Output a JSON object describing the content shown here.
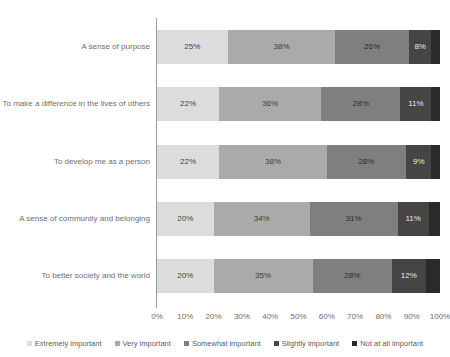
{
  "chart_data": {
    "type": "bar",
    "orientation": "horizontal",
    "stacked": true,
    "title": "",
    "xlabel": "",
    "ylabel": "",
    "xlim": [
      0,
      100
    ],
    "grid": false,
    "legend_position": "bottom",
    "xticks": [
      "0%",
      "10%",
      "20%",
      "30%",
      "40%",
      "50%",
      "60%",
      "70%",
      "80%",
      "90%",
      "100%"
    ],
    "categories": [
      "A sense of purpose",
      "To make a difference in the lives of others",
      "To develop me as a person",
      "A sense of community and belonging",
      "To better society and the world"
    ],
    "series": [
      {
        "name": "Extremely important",
        "color": "#dcdcdc",
        "values": [
          25,
          22,
          22,
          20,
          20
        ]
      },
      {
        "name": "Very important",
        "color": "#aaaaaa",
        "values": [
          38,
          36,
          38,
          34,
          35
        ]
      },
      {
        "name": "Somewhat important",
        "color": "#7f7f7f",
        "values": [
          26,
          28,
          28,
          31,
          28
        ]
      },
      {
        "name": "Slightly important",
        "color": "#454545",
        "values": [
          8,
          11,
          9,
          11,
          12
        ]
      },
      {
        "name": "Not at all important",
        "color": "#2a2a2a",
        "values": [
          3,
          3,
          3,
          4,
          5
        ]
      }
    ],
    "data_labels": [
      [
        "25%",
        "38%",
        "26%",
        "8%",
        ""
      ],
      [
        "22%",
        "36%",
        "28%",
        "11%",
        ""
      ],
      [
        "22%",
        "38%",
        "28%",
        "9%",
        ""
      ],
      [
        "20%",
        "34%",
        "31%",
        "11%",
        ""
      ],
      [
        "20%",
        "35%",
        "28%",
        "12%",
        ""
      ]
    ],
    "label_colors": [
      [
        "#444444",
        "#3a3a3a",
        "#2b2b2b",
        "#e8e8e8",
        "#ffffff"
      ],
      [
        "#444444",
        "#3a3a3a",
        "#2b2b2b",
        "#e8e8e8",
        "#ffffff"
      ],
      [
        "#444444",
        "#3a3a3a",
        "#2b2b2b",
        "#e8e8e8",
        "#ffffff"
      ],
      [
        "#444444",
        "#3a3a3a",
        "#2b2b2b",
        "#e8e8e8",
        "#ffffff"
      ],
      [
        "#444444",
        "#3a3a3a",
        "#2b2b2b",
        "#e8e8e8",
        "#ffffff"
      ]
    ]
  }
}
